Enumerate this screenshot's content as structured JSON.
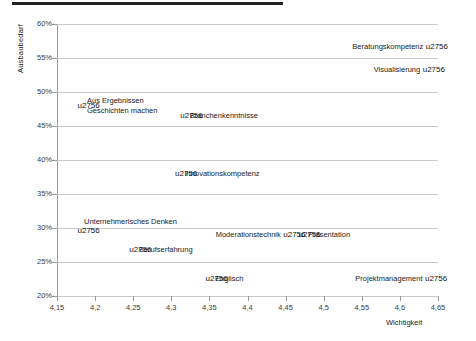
{
  "chart_data": {
    "type": "scatter",
    "title": "",
    "xlabel": "Wichtigkeit",
    "ylabel": "Ausbaubedarf",
    "xlim": [
      4.15,
      4.65
    ],
    "ylim": [
      0.2,
      0.6
    ],
    "grid": true,
    "legend": "none",
    "xticks": [
      "4,15",
      "4,2",
      "4,25",
      "4,3",
      "4,35",
      "4,4",
      "4,45",
      "4,5",
      "4,55",
      "4,6",
      "4,65"
    ],
    "xtick_values": [
      4.15,
      4.2,
      4.25,
      4.3,
      4.35,
      4.4,
      4.45,
      4.5,
      4.55,
      4.6,
      4.65
    ],
    "yticks": [
      "20%",
      "25%",
      "30%",
      "35%",
      "40%",
      "45%",
      "50%",
      "55%",
      "60%"
    ],
    "ytick_values": [
      0.2,
      0.25,
      0.3,
      0.35,
      0.4,
      0.45,
      0.5,
      0.55,
      0.6
    ],
    "points": [
      {
        "label": "Beratungskompetenz",
        "x": 4.6385,
        "y": 0.567,
        "label_side": "left"
      },
      {
        "label": "Visualisierung",
        "x": 4.6345,
        "y": 0.533,
        "label_side": "left"
      },
      {
        "label": "Aus Ergebnissen\nGeschichten machen",
        "x": 4.1815,
        "y": 0.4805,
        "label_side": "right"
      },
      {
        "label": "Branchenkenntnisse",
        "x": 4.3165,
        "y": 0.4655,
        "label_side": "right"
      },
      {
        "label": "Innovationskompetenz",
        "x": 4.3095,
        "y": 0.3805,
        "label_side": "right"
      },
      {
        "label": "Unternehmerisches Denken",
        "x": 4.1815,
        "y": 0.2965,
        "label_side": "above"
      },
      {
        "label": "Moderationstechnik",
        "x": 4.4515,
        "y": 0.29,
        "label_side": "left"
      },
      {
        "label": "Präsentation",
        "x": 4.4715,
        "y": 0.29,
        "label_side": "right"
      },
      {
        "label": "Berufserfahrung",
        "x": 4.2495,
        "y": 0.2685,
        "label_side": "right"
      },
      {
        "label": "Englisch",
        "x": 4.3495,
        "y": 0.2255,
        "label_side": "right"
      },
      {
        "label": "Projektmanagement",
        "x": 4.6375,
        "y": 0.2255,
        "label_side": "left"
      }
    ],
    "colors": {
      "marker": "#111111",
      "gridline": "#c9c9c9",
      "axis": "#9a9a9a",
      "topbar": "#231f20",
      "text": "#1a1a1a"
    }
  }
}
